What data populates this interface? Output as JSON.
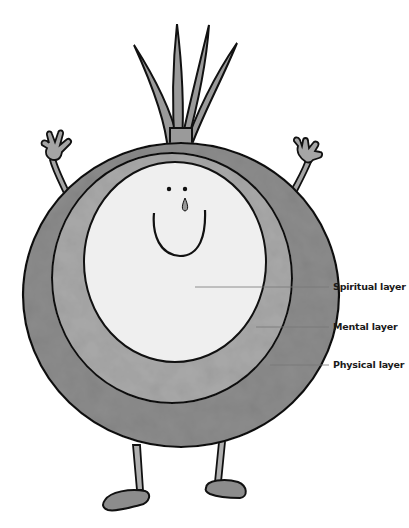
{
  "figure": {
    "colors": {
      "outline": "#111111",
      "outer_layer": "#8c8c8c",
      "middle_layer": "#a9a9a9",
      "inner_layer": "#efefef",
      "stem": "#9a9a9a",
      "leader_line": "#777777",
      "label_text": "#1a1a1a"
    }
  },
  "labels": [
    {
      "text": "Spiritual layer",
      "layer": "inner"
    },
    {
      "text": "Mental layer",
      "layer": "middle"
    },
    {
      "text": "Physical layer",
      "layer": "outer"
    }
  ]
}
